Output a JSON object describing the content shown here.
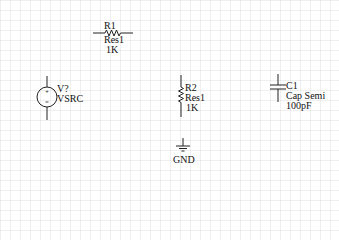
{
  "schematic": {
    "components": [
      {
        "designator": "R1",
        "comment": "Res1",
        "value": "1K",
        "type": "resistor",
        "orientation": "horizontal"
      },
      {
        "designator": "V?",
        "comment": "VSRC",
        "type": "voltage-source"
      },
      {
        "designator": "R2",
        "comment": "Res1",
        "value": "1K",
        "type": "resistor",
        "orientation": "vertical"
      },
      {
        "designator": "C1",
        "comment": "Cap Semi",
        "value": "100pF",
        "type": "capacitor"
      },
      {
        "designator": "",
        "comment": "GND",
        "type": "ground"
      }
    ],
    "colors": {
      "wire": "#222222",
      "text": "#111111",
      "grid": "#e6e6e6",
      "background": "#ffffff"
    }
  }
}
